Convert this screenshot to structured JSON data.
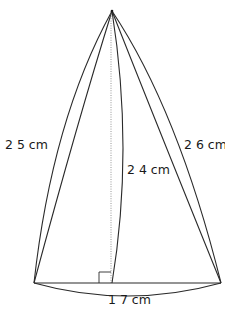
{
  "diagram": {
    "type": "cone-net-geometry",
    "colors": {
      "line": "#2a2a2a",
      "dotted_line": "#8a8a8a",
      "text": "#1a1a1a",
      "background": "#ffffff"
    },
    "labels": {
      "left_slant": "2 5 cm",
      "right_slant": "2 6 cm",
      "height": "2 4 cm",
      "base": "1 7 cm"
    },
    "measurements": {
      "left_slant_cm": 25,
      "right_slant_cm": 26,
      "height_cm": 24,
      "base_cm": 17
    },
    "markers": {
      "right_angle": true
    }
  }
}
